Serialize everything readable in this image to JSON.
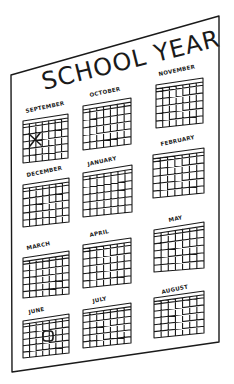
{
  "poster": {
    "title": "SCHOOL YEAR",
    "ink_color": "#1a1a1a",
    "paper_color": "#ffffff"
  },
  "calendars": [
    {
      "month": "SEPTEMBER",
      "mark": "x"
    },
    {
      "month": "OCTOBER",
      "mark": ""
    },
    {
      "month": "NOVEMBER",
      "mark": ""
    },
    {
      "month": "DECEMBER",
      "mark": ""
    },
    {
      "month": "JANUARY",
      "mark": ""
    },
    {
      "month": "FEBRUARY",
      "mark": ""
    },
    {
      "month": "MARCH",
      "mark": ""
    },
    {
      "month": "APRIL",
      "mark": ""
    },
    {
      "month": "MAY",
      "mark": ""
    },
    {
      "month": "JUNE",
      "mark": "circle"
    },
    {
      "month": "JULY",
      "mark": ""
    },
    {
      "month": "AUGUST",
      "mark": ""
    }
  ]
}
